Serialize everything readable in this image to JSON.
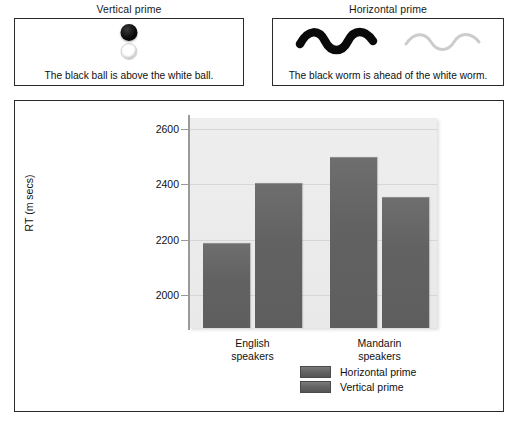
{
  "primes": [
    {
      "title": "Vertical prime",
      "caption": "The black ball is above the white ball.",
      "art": "two-balls-stacked",
      "black_object": "black-ball",
      "white_object": "white-ball"
    },
    {
      "title": "Horizontal prime",
      "caption": "The black worm is ahead of the white worm.",
      "art": "two-worms-side-by-side",
      "black_object": "black-worm",
      "white_object": "white-worm"
    }
  ],
  "chart_data": {
    "type": "bar",
    "title": "",
    "xlabel": "",
    "ylabel": "RT (m secs)",
    "categories": [
      "English speakers",
      "Mandarin speakers"
    ],
    "series": [
      {
        "name": "Horizontal prime",
        "values": [
          2185,
          2495
        ]
      },
      {
        "name": "Vertical prime",
        "values": [
          2400,
          2350
        ]
      }
    ],
    "yticks": [
      2000,
      2200,
      2400,
      2600
    ],
    "ylim": [
      1880,
      2640
    ],
    "grid": true,
    "legend_position": "bottom-center",
    "bar_color": "#626262",
    "plot_background": "#ededed"
  }
}
